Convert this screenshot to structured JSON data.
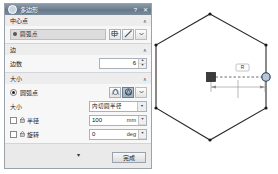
{
  "window": {
    "title": "多边形",
    "icon": "polygon-icon",
    "help_label": "?",
    "close_label": "✕"
  },
  "sections": {
    "center_point": {
      "title": "中心点",
      "collapse_label": "∧",
      "selection": {
        "value": "圆弧点",
        "icon": "point-marker-icon"
      },
      "buttons": [
        {
          "name": "pick-point-button",
          "icon": "crosshair-icon"
        },
        {
          "name": "construction-geometry-button",
          "icon": "pencil-icon"
        },
        {
          "name": "more-options-button",
          "icon": "chevron-down-icon"
        }
      ]
    },
    "sides": {
      "title": "边",
      "collapse_label": "∧",
      "count_label": "边数",
      "count_value": "6",
      "spinner_up": "▲",
      "spinner_down": "▼"
    },
    "size": {
      "title": "大小",
      "collapse_label": "∧",
      "mode_label": "圆弧点",
      "mode_buttons": [
        {
          "name": "size-mode-inscribed-button",
          "icon": "inscribed-circle-icon",
          "selected": false
        },
        {
          "name": "size-mode-circumscribed-button",
          "icon": "circumscribed-circle-icon",
          "selected": true
        },
        {
          "name": "size-mode-more-button",
          "icon": "chevron-down-icon",
          "selected": false
        }
      ],
      "type_label": "大小",
      "type_value": "内切圆半径",
      "type_arrow": "▼",
      "radius": {
        "label": "半径",
        "value": "100",
        "unit": "mm",
        "arrow": "▼",
        "lock_icon": "lock-icon",
        "checked": false
      },
      "angle": {
        "label": "旋转",
        "value": "0",
        "unit": "deg",
        "arrow": "▼",
        "lock_icon": "lock-icon",
        "checked": false
      }
    }
  },
  "footer": {
    "expand_label": "▾",
    "done_label": "完成"
  },
  "canvas": {
    "shape": "hexagon",
    "stroke_color": "#2b2b2b",
    "construction_color": "#7a7a7a",
    "center_point_label": "center-point",
    "endpoint_label": "polygon-vertex-handle",
    "dimension_hint": "R"
  }
}
